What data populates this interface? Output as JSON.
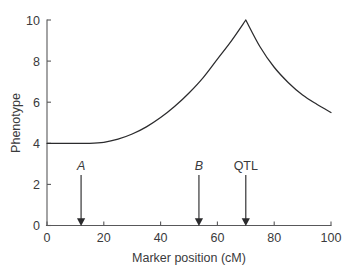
{
  "chart_data": {
    "type": "line",
    "title": "",
    "xlabel": "Marker position (cM)",
    "ylabel": "Phenotype",
    "xlim": [
      0,
      100
    ],
    "ylim": [
      0,
      10
    ],
    "xticks": [
      0,
      20,
      40,
      60,
      80,
      100
    ],
    "yticks": [
      0,
      2,
      4,
      6,
      8,
      10
    ],
    "xtick_labels": [
      "0",
      "20",
      "40",
      "60",
      "80",
      "100"
    ],
    "ytick_labels": [
      "0",
      "2",
      "4",
      "6",
      "8",
      "10"
    ],
    "grid": false,
    "legend": false,
    "series": [
      {
        "name": "Phenotype",
        "x": [
          0,
          5,
          10,
          15,
          20,
          25,
          30,
          35,
          40,
          45,
          50,
          55,
          60,
          65,
          70,
          75,
          80,
          85,
          90,
          95,
          100
        ],
        "values": [
          4.0,
          4.0,
          4.0,
          4.0,
          4.05,
          4.2,
          4.45,
          4.8,
          5.25,
          5.8,
          6.45,
          7.2,
          8.1,
          9.0,
          10.0,
          8.7,
          7.7,
          6.95,
          6.35,
          5.9,
          5.5
        ]
      }
    ],
    "annotations": [
      {
        "label": "A",
        "x": 12,
        "style": "italic",
        "marker": "down-arrow",
        "label_y": 2.6,
        "tip_y": 0
      },
      {
        "label": "B",
        "x": 53.5,
        "style": "italic",
        "marker": "down-arrow",
        "label_y": 2.6,
        "tip_y": 0
      },
      {
        "label": "QTL",
        "x": 70,
        "style": "normal",
        "marker": "down-arrow",
        "label_y": 2.6,
        "tip_y": 0
      }
    ],
    "colors": {
      "curve": "#2b2b2d",
      "axis": "#58585a",
      "text": "#3a3a3c",
      "arrow": "#2b2b2d",
      "background": "#ffffff"
    }
  }
}
